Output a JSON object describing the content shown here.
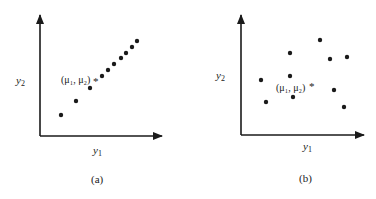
{
  "figure": {
    "panels": [
      {
        "id": "a",
        "caption": "(a)",
        "x_label": "y",
        "x_label_sub": "1",
        "y_label": "y",
        "y_label_sub": "2",
        "mean_label": "(μ₁, μ₂)",
        "mean_marker": "*",
        "description": "points strongly correlated along a line"
      },
      {
        "id": "b",
        "caption": "(b)",
        "x_label": "y",
        "x_label_sub": "1",
        "y_label": "y",
        "y_label_sub": "2",
        "mean_label": "(μ₁, μ₂)",
        "mean_marker": "*",
        "description": "points scattered, uncorrelated"
      }
    ],
    "colors": {
      "ink": "#1a1a1a",
      "background": "#ffffff"
    }
  }
}
